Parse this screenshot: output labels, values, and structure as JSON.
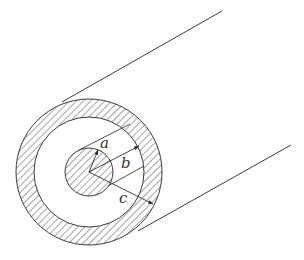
{
  "diagram": {
    "type": "coaxial-cable-cross-section",
    "colors": {
      "stroke": "#3a3a3a",
      "hatch": "#555555",
      "background": "#ffffff"
    },
    "labels": {
      "inner_radius": "a",
      "outer_conductor_inner_radius": "b",
      "outer_conductor_outer_radius": "c"
    }
  }
}
